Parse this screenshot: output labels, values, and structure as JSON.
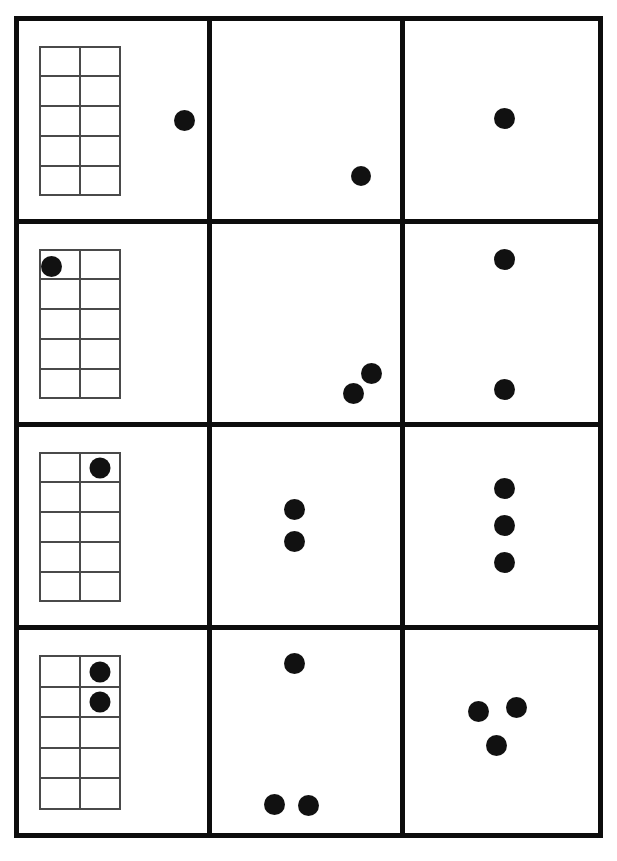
{
  "worksheet": {
    "title": "Ten-Frame Counting Worksheet",
    "frame_color": "#0d0d0d",
    "grid_line_color": "#4a4a4a",
    "counter_color": "#111111",
    "background_color": "#ffffff",
    "rows": 4,
    "columns": 3,
    "ten_frame": {
      "columns": 2,
      "rows": 5,
      "total_cells": 10
    },
    "cells": [
      {
        "id": "r1c1",
        "row": 1,
        "column": 1,
        "type": "ten-frame-with-loose-counter",
        "counter_count": 1,
        "ten_frame": {
          "left_pct": 10.5,
          "top_pct": 12.5,
          "width_pct": 44.0,
          "height_pct": 76.0,
          "filled_cells": []
        },
        "loose_counters": [
          {
            "cx_pct": 88.0,
            "cy_pct": 50.5,
            "d_px": 21
          }
        ]
      },
      {
        "id": "r1c2",
        "row": 1,
        "column": 2,
        "type": "loose-counters",
        "counter_count": 1,
        "loose_counters": [
          {
            "cx_pct": 79.5,
            "cy_pct": 78.5,
            "d_px": 20
          }
        ]
      },
      {
        "id": "r1c3",
        "row": 1,
        "column": 3,
        "type": "loose-counters",
        "counter_count": 1,
        "loose_counters": [
          {
            "cx_pct": 51.5,
            "cy_pct": 49.0,
            "d_px": 21
          }
        ]
      },
      {
        "id": "r2c1",
        "row": 2,
        "column": 1,
        "type": "ten-frame-with-loose-counter",
        "counter_count": 1,
        "ten_frame": {
          "left_pct": 10.5,
          "top_pct": 12.5,
          "width_pct": 44.0,
          "height_pct": 76.0,
          "filled_cells": []
        },
        "loose_counters": [
          {
            "cx_pct": 17.5,
            "cy_pct": 21.5,
            "d_px": 21
          }
        ]
      },
      {
        "id": "r2c2",
        "row": 2,
        "column": 2,
        "type": "loose-counters",
        "counter_count": 2,
        "loose_counters": [
          {
            "cx_pct": 85.0,
            "cy_pct": 75.5,
            "d_px": 21
          },
          {
            "cx_pct": 75.5,
            "cy_pct": 85.5,
            "d_px": 21
          }
        ]
      },
      {
        "id": "r2c3",
        "row": 2,
        "column": 3,
        "type": "loose-counters",
        "counter_count": 2,
        "loose_counters": [
          {
            "cx_pct": 51.5,
            "cy_pct": 18.0,
            "d_px": 21
          },
          {
            "cx_pct": 51.5,
            "cy_pct": 83.5,
            "d_px": 21
          }
        ]
      },
      {
        "id": "r3c1",
        "row": 3,
        "column": 1,
        "type": "ten-frame-filled",
        "counter_count": 1,
        "ten_frame": {
          "left_pct": 10.5,
          "top_pct": 12.5,
          "width_pct": 44.0,
          "height_pct": 76.0,
          "filled_cells": [
            2
          ]
        },
        "loose_counters": []
      },
      {
        "id": "r3c2",
        "row": 3,
        "column": 2,
        "type": "loose-counters",
        "counter_count": 2,
        "loose_counters": [
          {
            "cx_pct": 44.0,
            "cy_pct": 41.5,
            "d_px": 21
          },
          {
            "cx_pct": 44.0,
            "cy_pct": 58.0,
            "d_px": 21
          }
        ]
      },
      {
        "id": "r3c3",
        "row": 3,
        "column": 3,
        "type": "loose-counters",
        "counter_count": 3,
        "loose_counters": [
          {
            "cx_pct": 51.5,
            "cy_pct": 31.0,
            "d_px": 21
          },
          {
            "cx_pct": 51.5,
            "cy_pct": 49.5,
            "d_px": 21
          },
          {
            "cx_pct": 51.5,
            "cy_pct": 68.5,
            "d_px": 21
          }
        ]
      },
      {
        "id": "r4c1",
        "row": 4,
        "column": 1,
        "type": "ten-frame-filled",
        "counter_count": 2,
        "ten_frame": {
          "left_pct": 10.5,
          "top_pct": 12.5,
          "width_pct": 44.0,
          "height_pct": 76.0,
          "filled_cells": [
            2,
            4
          ]
        },
        "loose_counters": []
      },
      {
        "id": "r4c2",
        "row": 4,
        "column": 2,
        "type": "loose-counters",
        "counter_count": 3,
        "loose_counters": [
          {
            "cx_pct": 44.0,
            "cy_pct": 16.5,
            "d_px": 21
          },
          {
            "cx_pct": 33.0,
            "cy_pct": 86.0,
            "d_px": 21
          },
          {
            "cx_pct": 51.5,
            "cy_pct": 86.5,
            "d_px": 21
          }
        ]
      },
      {
        "id": "r4c3",
        "row": 4,
        "column": 3,
        "type": "loose-counters",
        "counter_count": 3,
        "loose_counters": [
          {
            "cx_pct": 38.0,
            "cy_pct": 40.0,
            "d_px": 21
          },
          {
            "cx_pct": 58.0,
            "cy_pct": 38.0,
            "d_px": 21
          },
          {
            "cx_pct": 47.5,
            "cy_pct": 57.0,
            "d_px": 21
          }
        ]
      }
    ]
  }
}
